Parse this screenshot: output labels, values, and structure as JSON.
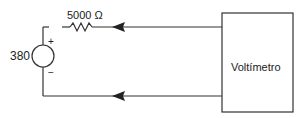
{
  "diagram": {
    "type": "circuit",
    "source": {
      "value_label": "380",
      "plus": "+",
      "minus": "−"
    },
    "resistor": {
      "label": "5000 Ω"
    },
    "meter": {
      "label": "Voltímetro"
    },
    "colors": {
      "line": "#333333",
      "background": "#ffffff"
    }
  }
}
